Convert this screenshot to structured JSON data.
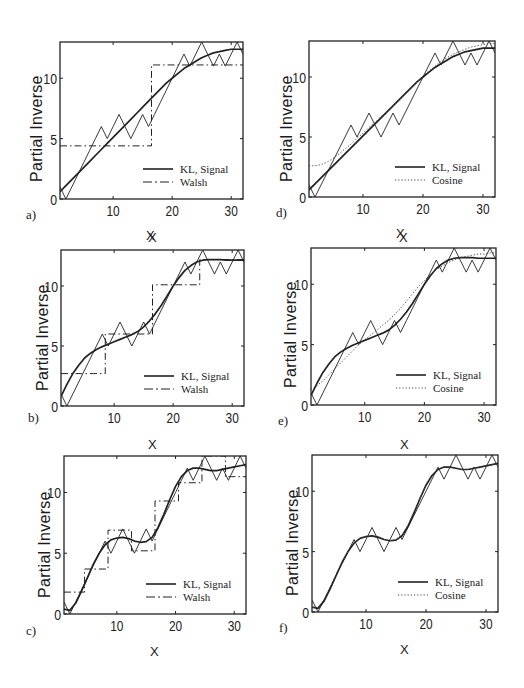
{
  "figure": {
    "panels": [
      {
        "id": "a",
        "tag": "a)",
        "basis": "Walsh",
        "ylabel": "Partial Inverse",
        "xlabel": "X",
        "legend": [
          "KL, Signal",
          "Walsh"
        ]
      },
      {
        "id": "b",
        "tag": "b)",
        "basis": "Walsh",
        "ylabel": "Partial Inverse",
        "xlabel": "X",
        "legend": [
          "KL, Signal",
          "Walsh"
        ]
      },
      {
        "id": "c",
        "tag": "c)",
        "basis": "Walsh",
        "ylabel": "Partial Inverse",
        "xlabel": "X",
        "legend": [
          "KL, Signal",
          "Walsh"
        ]
      },
      {
        "id": "d",
        "tag": "d)",
        "basis": "Cosine",
        "ylabel": "Partial Inverse",
        "xlabel": "X",
        "legend": [
          "KL, Signal",
          "Cosine"
        ]
      },
      {
        "id": "e",
        "tag": "e)",
        "basis": "Cosine",
        "ylabel": "Partial Inverse",
        "xlabel": "X",
        "legend": [
          "KL, Signal",
          "Cosine"
        ]
      },
      {
        "id": "f",
        "tag": "f)",
        "basis": "Cosine",
        "ylabel": "Partial Inverse",
        "xlabel": "X",
        "legend": [
          "KL, Signal",
          "Cosine"
        ]
      }
    ],
    "xticks": [
      "10",
      "20",
      "30"
    ],
    "yticks": [
      "0",
      "5",
      "10"
    ]
  },
  "chart_data": [
    {
      "panel": "a",
      "type": "line",
      "xlabel": "X",
      "ylabel": "Partial Inverse",
      "xlim": [
        1,
        32
      ],
      "ylim": [
        0,
        13
      ],
      "xticks": [
        10,
        20,
        30
      ],
      "yticks": [
        0,
        5,
        10
      ],
      "legend": [
        "KL, Signal",
        "Walsh"
      ],
      "legend_position": "lower right",
      "x": [
        1,
        2,
        3,
        4,
        5,
        6,
        7,
        8,
        9,
        10,
        11,
        12,
        13,
        14,
        15,
        16,
        17,
        18,
        19,
        20,
        21,
        22,
        23,
        24,
        25,
        26,
        27,
        28,
        29,
        30,
        31,
        32
      ],
      "series": [
        {
          "name": "Signal",
          "style": "solid-thin",
          "values": [
            1,
            0,
            1,
            2,
            3,
            4,
            5,
            6,
            5,
            6,
            7,
            6,
            5,
            6,
            7,
            6,
            7,
            8,
            9,
            10,
            11,
            12,
            11,
            12,
            13,
            12,
            11,
            12,
            11,
            12,
            13,
            12
          ]
        },
        {
          "name": "KL",
          "style": "solid-thick",
          "values": [
            0.6,
            1.1,
            1.6,
            2.1,
            2.6,
            3.1,
            3.6,
            4.1,
            4.6,
            5.1,
            5.6,
            6.1,
            6.6,
            7.1,
            7.6,
            8.1,
            8.6,
            9.1,
            9.6,
            10.0,
            10.4,
            10.8,
            11.1,
            11.4,
            11.7,
            11.9,
            12.1,
            12.2,
            12.3,
            12.4,
            12.4,
            12.4
          ]
        },
        {
          "name": "Walsh",
          "style": "dash-dot",
          "values": [
            4.4,
            4.4,
            4.4,
            4.4,
            4.4,
            4.4,
            4.4,
            4.4,
            4.4,
            4.4,
            4.4,
            4.4,
            4.4,
            4.4,
            4.4,
            4.4,
            11.1,
            11.1,
            11.1,
            11.1,
            11.1,
            11.1,
            11.1,
            11.1,
            11.1,
            11.1,
            11.1,
            11.1,
            11.1,
            11.1,
            11.1,
            11.1
          ]
        }
      ]
    },
    {
      "panel": "b",
      "type": "line",
      "xlabel": "X",
      "ylabel": "Partial Inverse",
      "xlim": [
        1,
        32
      ],
      "ylim": [
        0,
        13
      ],
      "xticks": [
        10,
        20,
        30
      ],
      "yticks": [
        0,
        5,
        10
      ],
      "legend": [
        "KL, Signal",
        "Walsh"
      ],
      "legend_position": "lower right",
      "x": [
        1,
        2,
        3,
        4,
        5,
        6,
        7,
        8,
        9,
        10,
        11,
        12,
        13,
        14,
        15,
        16,
        17,
        18,
        19,
        20,
        21,
        22,
        23,
        24,
        25,
        26,
        27,
        28,
        29,
        30,
        31,
        32
      ],
      "series": [
        {
          "name": "Signal",
          "style": "solid-thin",
          "values": [
            1,
            0,
            1,
            2,
            3,
            4,
            5,
            6,
            5,
            6,
            7,
            6,
            5,
            6,
            7,
            6,
            7,
            8,
            9,
            10,
            11,
            12,
            11,
            12,
            13,
            12,
            11,
            12,
            11,
            12,
            13,
            12
          ]
        },
        {
          "name": "KL",
          "style": "solid-thick",
          "values": [
            0.8,
            1.8,
            2.7,
            3.4,
            4.0,
            4.4,
            4.7,
            4.95,
            5.15,
            5.35,
            5.55,
            5.75,
            5.95,
            6.2,
            6.6,
            7.1,
            7.7,
            8.4,
            9.2,
            10.0,
            10.7,
            11.3,
            11.7,
            12.0,
            12.15,
            12.2,
            12.2,
            12.2,
            12.15,
            12.15,
            12.15,
            12.15
          ]
        },
        {
          "name": "Walsh",
          "style": "dash-dot",
          "values": [
            2.7,
            2.7,
            2.7,
            2.7,
            2.7,
            2.7,
            2.7,
            2.7,
            6.0,
            6.0,
            6.0,
            6.0,
            6.0,
            6.0,
            6.0,
            6.0,
            10.1,
            10.1,
            10.1,
            10.1,
            10.1,
            10.1,
            10.1,
            10.1,
            12.2,
            12.2,
            12.2,
            12.2,
            12.2,
            12.2,
            12.2,
            12.2
          ]
        }
      ]
    },
    {
      "panel": "c",
      "type": "line",
      "xlabel": "X",
      "ylabel": "Partial Inverse",
      "xlim": [
        1,
        32
      ],
      "ylim": [
        0,
        13
      ],
      "xticks": [
        10,
        20,
        30
      ],
      "yticks": [
        0,
        5,
        10
      ],
      "legend": [
        "KL, Signal",
        "Walsh"
      ],
      "legend_position": "lower right",
      "x": [
        1,
        2,
        3,
        4,
        5,
        6,
        7,
        8,
        9,
        10,
        11,
        12,
        13,
        14,
        15,
        16,
        17,
        18,
        19,
        20,
        21,
        22,
        23,
        24,
        25,
        26,
        27,
        28,
        29,
        30,
        31,
        32
      ],
      "series": [
        {
          "name": "Signal",
          "style": "solid-thin",
          "values": [
            1,
            0,
            1,
            2,
            3,
            4,
            5,
            6,
            5,
            6,
            7,
            6,
            5,
            6,
            7,
            6,
            7,
            8,
            9,
            10,
            11,
            12,
            11,
            12,
            13,
            12,
            11,
            12,
            11,
            12,
            13,
            12
          ]
        },
        {
          "name": "KL",
          "style": "solid-thick",
          "values": [
            0.4,
            0.3,
            0.9,
            1.9,
            3.0,
            4.1,
            5.0,
            5.7,
            6.1,
            6.25,
            6.3,
            6.2,
            6.0,
            5.9,
            5.95,
            6.3,
            7.1,
            8.2,
            9.4,
            10.5,
            11.3,
            11.8,
            12.0,
            12.0,
            11.9,
            11.8,
            11.8,
            11.9,
            12.0,
            12.1,
            12.2,
            12.3
          ]
        },
        {
          "name": "Walsh",
          "style": "dash-dot",
          "values": [
            1.8,
            1.8,
            1.8,
            1.8,
            3.7,
            3.7,
            3.7,
            3.7,
            6.9,
            6.9,
            6.9,
            6.9,
            5.2,
            5.2,
            5.2,
            5.2,
            9.3,
            9.3,
            9.3,
            9.3,
            10.8,
            10.8,
            10.8,
            10.8,
            13.0,
            13.0,
            13.0,
            13.0,
            11.3,
            11.3,
            11.3,
            11.3
          ]
        }
      ]
    },
    {
      "panel": "d",
      "type": "line",
      "xlabel": "X",
      "ylabel": "Partial Inverse",
      "xlim": [
        1,
        32
      ],
      "ylim": [
        0,
        13
      ],
      "xticks": [
        10,
        20,
        30
      ],
      "yticks": [
        0,
        5,
        10
      ],
      "legend": [
        "KL, Signal",
        "Cosine"
      ],
      "legend_position": "lower right",
      "x": [
        1,
        2,
        3,
        4,
        5,
        6,
        7,
        8,
        9,
        10,
        11,
        12,
        13,
        14,
        15,
        16,
        17,
        18,
        19,
        20,
        21,
        22,
        23,
        24,
        25,
        26,
        27,
        28,
        29,
        30,
        31,
        32
      ],
      "series": [
        {
          "name": "Signal",
          "style": "solid-thin",
          "values": [
            1,
            0,
            1,
            2,
            3,
            4,
            5,
            6,
            5,
            6,
            7,
            6,
            5,
            6,
            7,
            6,
            7,
            8,
            9,
            10,
            11,
            12,
            11,
            12,
            13,
            12,
            11,
            12,
            11,
            12,
            13,
            12
          ]
        },
        {
          "name": "KL",
          "style": "solid-thick",
          "values": [
            0.6,
            1.1,
            1.6,
            2.1,
            2.6,
            3.1,
            3.6,
            4.1,
            4.6,
            5.1,
            5.6,
            6.1,
            6.6,
            7.1,
            7.6,
            8.1,
            8.6,
            9.1,
            9.6,
            10.0,
            10.4,
            10.8,
            11.1,
            11.4,
            11.7,
            11.9,
            12.1,
            12.2,
            12.3,
            12.4,
            12.4,
            12.4
          ]
        },
        {
          "name": "Cosine",
          "style": "dotted",
          "values": [
            2.6,
            2.6,
            2.7,
            2.9,
            3.2,
            3.6,
            4.0,
            4.4,
            4.9,
            5.3,
            5.8,
            6.2,
            6.7,
            7.1,
            7.6,
            8.1,
            8.6,
            9.1,
            9.6,
            10.1,
            10.5,
            10.9,
            11.3,
            11.6,
            11.9,
            12.1,
            12.3,
            12.5,
            12.6,
            12.7,
            12.8,
            12.8
          ]
        }
      ]
    },
    {
      "panel": "e",
      "type": "line",
      "xlabel": "X",
      "ylabel": "Partial Inverse",
      "xlim": [
        1,
        32
      ],
      "ylim": [
        0,
        13
      ],
      "xticks": [
        10,
        20,
        30
      ],
      "yticks": [
        0,
        5,
        10
      ],
      "legend": [
        "KL, Signal",
        "Cosine"
      ],
      "legend_position": "lower right",
      "x": [
        1,
        2,
        3,
        4,
        5,
        6,
        7,
        8,
        9,
        10,
        11,
        12,
        13,
        14,
        15,
        16,
        17,
        18,
        19,
        20,
        21,
        22,
        23,
        24,
        25,
        26,
        27,
        28,
        29,
        30,
        31,
        32
      ],
      "series": [
        {
          "name": "Signal",
          "style": "solid-thin",
          "values": [
            1,
            0,
            1,
            2,
            3,
            4,
            5,
            6,
            5,
            6,
            7,
            6,
            5,
            6,
            7,
            6,
            7,
            8,
            9,
            10,
            11,
            12,
            11,
            12,
            13,
            12,
            11,
            12,
            11,
            12,
            13,
            12
          ]
        },
        {
          "name": "KL",
          "style": "solid-thick",
          "values": [
            0.8,
            1.8,
            2.7,
            3.4,
            4.0,
            4.4,
            4.7,
            4.95,
            5.15,
            5.35,
            5.55,
            5.75,
            5.95,
            6.2,
            6.6,
            7.1,
            7.7,
            8.4,
            9.2,
            10.0,
            10.7,
            11.3,
            11.7,
            12.0,
            12.15,
            12.2,
            12.2,
            12.2,
            12.15,
            12.15,
            12.15,
            12.15
          ]
        },
        {
          "name": "Cosine",
          "style": "dotted",
          "values": [
            1.3,
            1.6,
            2.0,
            2.5,
            3.0,
            3.5,
            4.0,
            4.5,
            5.0,
            5.4,
            5.8,
            6.2,
            6.6,
            7.0,
            7.5,
            8.0,
            8.6,
            9.2,
            9.8,
            10.3,
            10.8,
            11.2,
            11.5,
            11.8,
            12.0,
            12.2,
            12.3,
            12.4,
            12.5,
            12.5,
            12.6,
            12.6
          ]
        }
      ]
    },
    {
      "panel": "f",
      "type": "line",
      "xlabel": "X",
      "ylabel": "Partial Inverse",
      "xlim": [
        1,
        32
      ],
      "ylim": [
        0,
        13
      ],
      "xticks": [
        10,
        20,
        30
      ],
      "yticks": [
        0,
        5,
        10
      ],
      "legend": [
        "KL, Signal",
        "Cosine"
      ],
      "legend_position": "lower right",
      "x": [
        1,
        2,
        3,
        4,
        5,
        6,
        7,
        8,
        9,
        10,
        11,
        12,
        13,
        14,
        15,
        16,
        17,
        18,
        19,
        20,
        21,
        22,
        23,
        24,
        25,
        26,
        27,
        28,
        29,
        30,
        31,
        32
      ],
      "series": [
        {
          "name": "Signal",
          "style": "solid-thin",
          "values": [
            1,
            0,
            1,
            2,
            3,
            4,
            5,
            6,
            5,
            6,
            7,
            6,
            5,
            6,
            7,
            6,
            7,
            8,
            9,
            10,
            11,
            12,
            11,
            12,
            13,
            12,
            11,
            12,
            11,
            12,
            13,
            12
          ]
        },
        {
          "name": "KL",
          "style": "solid-thick",
          "values": [
            0.4,
            0.3,
            0.9,
            1.9,
            3.0,
            4.1,
            5.0,
            5.7,
            6.1,
            6.25,
            6.3,
            6.2,
            6.0,
            5.9,
            5.95,
            6.3,
            7.1,
            8.2,
            9.4,
            10.5,
            11.3,
            11.8,
            12.0,
            12.0,
            11.9,
            11.8,
            11.8,
            11.9,
            12.0,
            12.1,
            12.2,
            12.3
          ]
        },
        {
          "name": "Cosine",
          "style": "dotted",
          "values": [
            0.4,
            0.4,
            1.0,
            2.0,
            3.1,
            4.1,
            5.0,
            5.7,
            6.1,
            6.2,
            6.25,
            6.15,
            6.0,
            5.9,
            6.0,
            6.4,
            7.2,
            8.3,
            9.4,
            10.5,
            11.3,
            11.8,
            12.0,
            12.0,
            11.9,
            11.8,
            11.8,
            11.9,
            12.0,
            12.1,
            12.2,
            12.3
          ]
        }
      ]
    }
  ]
}
